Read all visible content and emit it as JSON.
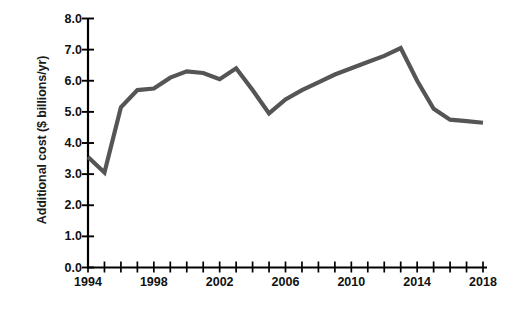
{
  "chart_data": {
    "type": "line",
    "title": "",
    "xlabel": "",
    "ylabel": "Additional cost ($ billions/yr)",
    "xlim": [
      1994,
      2018
    ],
    "ylim": [
      0.0,
      8.0
    ],
    "grid": false,
    "legend": "none",
    "yticks": [
      "0.0",
      "1.0",
      "2.0",
      "3.0",
      "4.0",
      "5.0",
      "6.0",
      "7.0",
      "8.0"
    ],
    "ytick_values": [
      0.0,
      1.0,
      2.0,
      3.0,
      4.0,
      5.0,
      6.0,
      7.0,
      8.0
    ],
    "xticks": [
      "1994",
      "1998",
      "2002",
      "2006",
      "2010",
      "2014",
      "2018"
    ],
    "xtick_values": [
      1994,
      1998,
      2002,
      2006,
      2010,
      2014,
      2018
    ],
    "x_minor_interval": 1,
    "line_color": "#555555",
    "axis_color": "#000000",
    "x": [
      1994,
      1995,
      1996,
      1997,
      1998,
      1999,
      2000,
      2001,
      2002,
      2003,
      2004,
      2005,
      2006,
      2007,
      2008,
      2009,
      2010,
      2011,
      2012,
      2013,
      2014,
      2015,
      2016,
      2017,
      2018
    ],
    "values": [
      3.55,
      3.05,
      5.15,
      5.7,
      5.75,
      6.1,
      6.3,
      6.25,
      6.05,
      6.4,
      5.7,
      4.95,
      5.4,
      5.7,
      5.95,
      6.2,
      6.4,
      6.6,
      6.8,
      7.05,
      6.0,
      5.1,
      4.75,
      4.7,
      4.65
    ],
    "series": [
      {
        "name": "Additional cost",
        "values": [
          3.55,
          3.05,
          5.15,
          5.7,
          5.75,
          6.1,
          6.3,
          6.25,
          6.05,
          6.4,
          5.7,
          4.95,
          5.4,
          5.7,
          5.95,
          6.2,
          6.4,
          6.6,
          6.8,
          7.05,
          6.0,
          5.1,
          4.75,
          4.7,
          4.65
        ]
      }
    ]
  }
}
